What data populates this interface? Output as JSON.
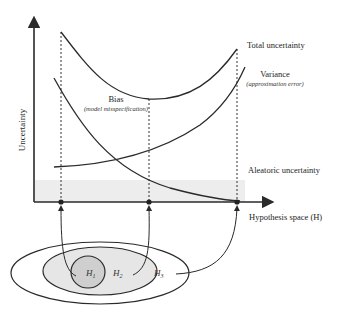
{
  "diagram": {
    "title": "",
    "axes": {
      "y_label": "Uncertainty",
      "x_label": "Hypothesis space (H)"
    },
    "curves": {
      "total": {
        "label": "Total uncertainty"
      },
      "variance": {
        "label": "Variance",
        "sublabel": "(approximation error)"
      },
      "bias": {
        "label": "Bias",
        "sublabel": "(model misspecification)"
      },
      "aleatoric": {
        "label": "Aleatoric uncertainty"
      }
    },
    "hypothesis_sets": [
      {
        "id": "H1",
        "label": "H",
        "subscript": "1"
      },
      {
        "id": "H2",
        "label": "H",
        "subscript": "2"
      },
      {
        "id": "H3",
        "label": "H",
        "subscript": "3"
      }
    ],
    "colors": {
      "line": "#2a2a2a",
      "aleatoric_band": "#ededed",
      "inner_set": "#cfcfcf",
      "middle_set": "#e6e6e6",
      "outer_set": "#ffffff"
    }
  }
}
